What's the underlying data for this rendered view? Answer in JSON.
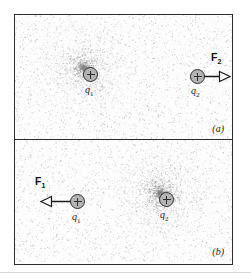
{
  "figure": {
    "panels": [
      {
        "tag": "(a)",
        "charges": [
          {
            "name": "q1",
            "label": "q",
            "subscript": "1",
            "sign": "+",
            "glow": "strong",
            "x": 68,
            "y": 52
          },
          {
            "name": "q2",
            "label": "q",
            "subscript": "2",
            "sign": "+",
            "glow": "none",
            "x": 175,
            "y": 54
          }
        ],
        "force": {
          "name": "F2",
          "label": "F",
          "subscript": "2",
          "direction": "right",
          "from_charge": "q2",
          "label_x": 196,
          "label_y": 36
        }
      },
      {
        "tag": "(b)",
        "charges": [
          {
            "name": "q1",
            "label": "q",
            "subscript": "1",
            "sign": "+",
            "glow": "none",
            "x": 55,
            "y": 54
          },
          {
            "name": "q2",
            "label": "q",
            "subscript": "2",
            "sign": "+",
            "glow": "strong",
            "x": 144,
            "y": 52
          }
        ],
        "force": {
          "name": "F1",
          "label": "F",
          "subscript": "1",
          "direction": "left",
          "from_charge": "q1",
          "label_x": 20,
          "label_y": 35
        }
      }
    ],
    "colors": {
      "frame": "#2b2b2b",
      "charge_fill": "#b4b4b4",
      "charge_stroke": "#2e2e2e",
      "arrow": "#1a1a1a",
      "stipple": "#9a9a9a",
      "glow": "#8a8a8a",
      "background": "#ffffff"
    }
  }
}
